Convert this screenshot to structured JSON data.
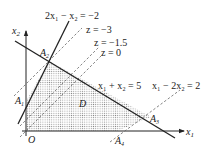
{
  "diagram": {
    "type": "linear-programming-feasible-region",
    "axes": {
      "x_label": "x",
      "x_sub": "1",
      "y_label": "x",
      "y_sub": "2",
      "origin_label": "O"
    },
    "region_label": "D",
    "vertices": [
      {
        "name": "A",
        "sub": "1"
      },
      {
        "name": "A",
        "sub": "2"
      },
      {
        "name": "A",
        "sub": "3"
      },
      {
        "name": "A",
        "sub": "4"
      }
    ],
    "constraints": [
      {
        "id": "c1",
        "text": "2x₁ − x₂ = −2",
        "style": "solid"
      },
      {
        "id": "c2",
        "text": "x₁ + x₂ = 5",
        "style": "solid"
      },
      {
        "id": "c3",
        "text": "x₁ − 2x₂ = 2",
        "style": "dashed"
      }
    ],
    "objective_levels": [
      {
        "text": "z = −3"
      },
      {
        "text": "z = −1.5"
      },
      {
        "text": "z = 0"
      }
    ],
    "colors": {
      "line": "#222222",
      "dashed": "#666666",
      "region_dot": "#888888",
      "background": "#ffffff"
    }
  }
}
